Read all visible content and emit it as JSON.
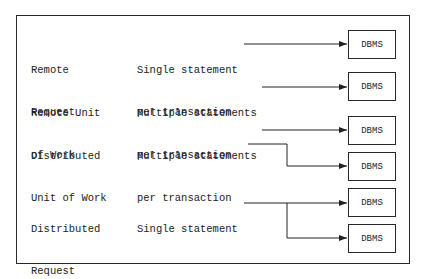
{
  "rows": [
    {
      "type_line1": "Remote",
      "type_line2": "Request",
      "desc_line1": "Single statement",
      "desc_line2": "per transaction"
    },
    {
      "type_line1": "Remote Unit",
      "type_line2": "of Work",
      "desc_line1": "Multiple statements",
      "desc_line2": "per transaction"
    },
    {
      "type_line1": "Distributed",
      "type_line2": "Unit of Work",
      "desc_line1": "Multiple statements",
      "desc_line2": "per transaction"
    },
    {
      "type_line1": "Distributed",
      "type_line2": "Request",
      "desc_line1": "Single statement",
      "desc_line2": ""
    }
  ],
  "targets": [
    {
      "label": "DBMS"
    },
    {
      "label": "DBMS"
    },
    {
      "label": "DBMS"
    },
    {
      "label": "DBMS"
    },
    {
      "label": "DBMS"
    },
    {
      "label": "DBMS"
    }
  ],
  "colors": {
    "ink": "#222222",
    "background": "#ffffff"
  }
}
